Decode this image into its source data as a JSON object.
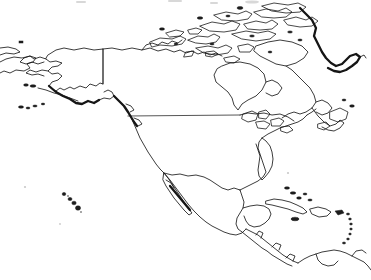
{
  "figure": {
    "title": "North America Outline Map",
    "kind": "line-art-outline-map",
    "width": 371,
    "height": 280,
    "background_color": "#ffffff",
    "line_color": "#1a1a1a",
    "style_note": "scanned black-and-white coastline outline, no fill, no labels"
  },
  "labels": {
    "none_visible": ""
  },
  "regions": [
    {
      "id": "chukotka",
      "name": "Chukotka (NE Russia)",
      "bbox": [
        0,
        42,
        40,
        52
      ]
    },
    {
      "id": "alaska",
      "name": "Alaska",
      "bbox": [
        18,
        40,
        115,
        60
      ]
    },
    {
      "id": "aleutians",
      "name": "Aleutian Islands",
      "bbox": [
        20,
        85,
        95,
        25
      ]
    },
    {
      "id": "yukon-nwt",
      "name": "Yukon / Northwest Territories",
      "bbox": [
        100,
        45,
        110,
        60
      ]
    },
    {
      "id": "arctic-archipelago",
      "name": "Canadian Arctic Archipelago",
      "bbox": [
        140,
        5,
        160,
        60
      ]
    },
    {
      "id": "greenland-west",
      "name": "Greenland (west coast)",
      "bbox": [
        300,
        10,
        71,
        80
      ]
    },
    {
      "id": "hudson-bay",
      "name": "Hudson Bay",
      "bbox": [
        215,
        60,
        90,
        65
      ]
    },
    {
      "id": "canada-mainland",
      "name": "Canada mainland",
      "bbox": [
        100,
        45,
        230,
        85
      ]
    },
    {
      "id": "labrador-newfoundland",
      "name": "Labrador / Newfoundland",
      "bbox": [
        290,
        85,
        60,
        55
      ]
    },
    {
      "id": "contiguous-us",
      "name": "Contiguous United States",
      "bbox": [
        120,
        115,
        180,
        75
      ]
    },
    {
      "id": "great-lakes",
      "name": "Great Lakes",
      "bbox": [
        240,
        110,
        50,
        28
      ]
    },
    {
      "id": "florida",
      "name": "Florida Peninsula",
      "bbox": [
        255,
        160,
        25,
        35
      ]
    },
    {
      "id": "baja-california",
      "name": "Baja California",
      "bbox": [
        155,
        170,
        40,
        45
      ]
    },
    {
      "id": "mexico",
      "name": "Mexico",
      "bbox": [
        160,
        165,
        110,
        70
      ]
    },
    {
      "id": "yucatan",
      "name": "Yucatán Peninsula",
      "bbox": [
        235,
        195,
        35,
        25
      ]
    },
    {
      "id": "central-america",
      "name": "Central America",
      "bbox": [
        235,
        215,
        60,
        45
      ]
    },
    {
      "id": "cuba",
      "name": "Cuba",
      "bbox": [
        265,
        200,
        45,
        15
      ]
    },
    {
      "id": "hispaniola",
      "name": "Hispaniola",
      "bbox": [
        305,
        208,
        25,
        12
      ]
    },
    {
      "id": "lesser-antilles",
      "name": "Lesser Antilles",
      "bbox": [
        330,
        205,
        25,
        35
      ]
    },
    {
      "id": "bahamas",
      "name": "Bahamas",
      "bbox": [
        285,
        185,
        25,
        22
      ]
    },
    {
      "id": "hawaii",
      "name": "Hawaiian Islands",
      "bbox": [
        62,
        192,
        22,
        20
      ]
    },
    {
      "id": "northern-south-america",
      "name": "Northern South America",
      "bbox": [
        300,
        240,
        71,
        40
      ]
    }
  ],
  "borders": [
    {
      "id": "alaska-canada-border",
      "name": "Alaska–Canada border (141°W meridian)",
      "type": "straight-vertical"
    },
    {
      "id": "us-canada-border",
      "name": "United States–Canada border (49th parallel)",
      "type": "straight-horizontal"
    }
  ],
  "artifacts": {
    "description": "faint scanner smudges along the top edge",
    "count": 4
  }
}
